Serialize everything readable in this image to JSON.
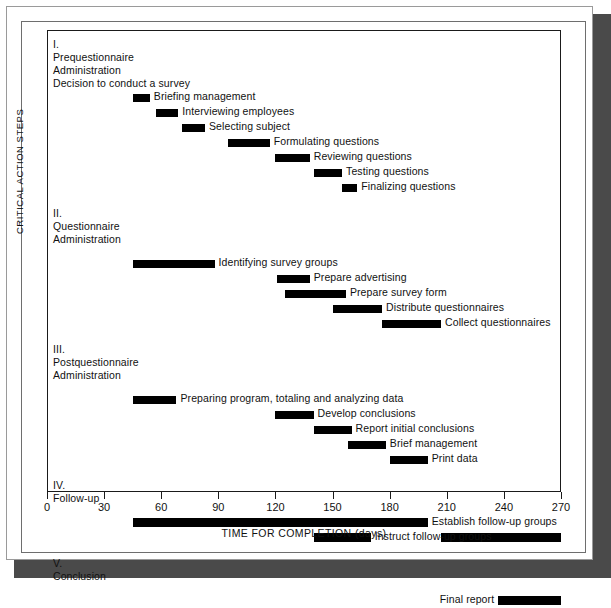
{
  "chart_data": {
    "type": "bar",
    "subtype": "gantt",
    "title": "",
    "xlabel": "TIME FOR COMPLETION (days)",
    "ylabel": "CRITICAL ACTION STEPS",
    "xlim": [
      0,
      270
    ],
    "xticks": [
      0,
      30,
      60,
      90,
      120,
      150,
      180,
      210,
      240,
      270
    ],
    "xtick_labels": [
      "0",
      "30",
      "60",
      "90",
      "120",
      "150",
      "180",
      "210",
      "240",
      "270"
    ],
    "grid": false,
    "legend": "none",
    "bar_color": "#000000",
    "sections": [
      {
        "numeral": "I.",
        "name_lines": [
          "Prequestionnaire",
          "Administration"
        ],
        "intro_text": "Decision to conduct a survey",
        "tasks": [
          {
            "label": "Briefing management",
            "start": 45,
            "end": 54,
            "label_side": "right"
          },
          {
            "label": "Interviewing employees",
            "start": 57,
            "end": 69,
            "label_side": "right"
          },
          {
            "label": "Selecting subject",
            "start": 71,
            "end": 83,
            "label_side": "right"
          },
          {
            "label": "Formulating questions",
            "start": 95,
            "end": 117,
            "label_side": "right"
          },
          {
            "label": "Reviewing questions",
            "start": 120,
            "end": 138,
            "label_side": "right"
          },
          {
            "label": "Testing questions",
            "start": 140,
            "end": 155,
            "label_side": "right"
          },
          {
            "label": "Finalizing questions",
            "start": 155,
            "end": 163,
            "label_side": "right"
          }
        ]
      },
      {
        "numeral": "II.",
        "name_lines": [
          "Questionnaire",
          "Administration"
        ],
        "intro_text": "",
        "tasks": [
          {
            "label": "Identifying survey groups",
            "start": 45,
            "end": 88,
            "label_side": "right"
          },
          {
            "label": "Prepare advertising",
            "start": 121,
            "end": 138,
            "label_side": "right"
          },
          {
            "label": "Prepare survey form",
            "start": 125,
            "end": 157,
            "label_side": "right"
          },
          {
            "label": "Distribute questionnaires",
            "start": 150,
            "end": 176,
            "label_side": "right"
          },
          {
            "label": "Collect questionnaires",
            "start": 176,
            "end": 207,
            "label_side": "right"
          }
        ]
      },
      {
        "numeral": "III.",
        "name_lines": [
          "Postquestionnaire",
          "Administration"
        ],
        "intro_text": "",
        "tasks": [
          {
            "label": "Preparing program, totaling and analyzing data",
            "start": 45,
            "end": 68,
            "label_side": "right"
          },
          {
            "label": "Develop conclusions",
            "start": 120,
            "end": 140,
            "label_side": "right"
          },
          {
            "label": "Report initial conclusions",
            "start": 140,
            "end": 160,
            "label_side": "right"
          },
          {
            "label": "Brief management",
            "start": 158,
            "end": 178,
            "label_side": "right"
          },
          {
            "label": "Print data",
            "start": 180,
            "end": 200,
            "label_side": "right"
          }
        ]
      },
      {
        "numeral": "IV.",
        "name_lines": [
          "Follow-up"
        ],
        "intro_text": "",
        "tasks": [
          {
            "label": "Establish follow-up groups",
            "start": 45,
            "end": 200,
            "label_side": "right",
            "thick": true
          },
          {
            "label": "Instruct follow-up groups",
            "start": 140,
            "end": 170,
            "label_side": "right",
            "thick": true,
            "extra_bar": {
              "start": 207,
              "end": 270
            }
          }
        ]
      },
      {
        "numeral": "V.",
        "name_lines": [
          "Conclusion"
        ],
        "intro_text": "",
        "tasks": [
          {
            "label": "Final report",
            "start": 237,
            "end": 270,
            "label_side": "left",
            "thick": true
          }
        ]
      }
    ]
  }
}
